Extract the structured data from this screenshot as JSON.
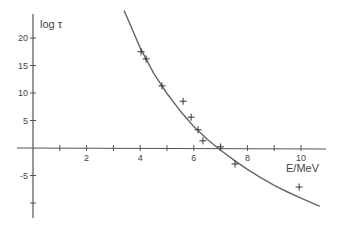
{
  "chart_data": {
    "type": "scatter",
    "title": "",
    "xlabel": "E/MeV",
    "ylabel": "log τ",
    "xlim": [
      0,
      11
    ],
    "ylim": [
      -12,
      25
    ],
    "grid": false,
    "x_ticks": [
      1,
      2,
      3,
      4,
      5,
      6,
      7,
      8,
      9,
      10
    ],
    "x_tick_labels": [
      "2",
      "4",
      "6",
      "8",
      "10"
    ],
    "x_tick_label_values": [
      2,
      4,
      6,
      8,
      10
    ],
    "y_ticks": [
      20,
      15,
      10,
      5,
      -5,
      -10
    ],
    "y_tick_labels": [
      "20",
      "15",
      "10",
      "5",
      "-5"
    ],
    "y_tick_label_values": [
      20,
      15,
      10,
      5,
      -5
    ],
    "series": [
      {
        "name": "measured",
        "marker": "+",
        "x": [
          4.03,
          4.22,
          4.81,
          5.6,
          5.9,
          6.16,
          6.34,
          7.0,
          7.54,
          9.93
        ],
        "y": [
          17.5,
          16.2,
          11.3,
          8.5,
          5.6,
          3.3,
          1.3,
          0.2,
          -2.9,
          -7.1
        ]
      },
      {
        "name": "fit",
        "style": "line",
        "x": [
          3.4,
          4.0,
          4.5,
          5.0,
          5.5,
          6.0,
          6.5,
          7.0,
          7.5,
          8.0,
          8.5,
          9.0,
          9.5,
          10.0,
          10.7
        ],
        "y": [
          25.0,
          18.2,
          13.6,
          9.9,
          6.7,
          3.9,
          1.6,
          -0.4,
          -2.2,
          -3.9,
          -5.4,
          -6.8,
          -8.0,
          -9.1,
          -10.6
        ]
      }
    ]
  },
  "axes": {
    "xlabel": "E/MeV",
    "ylabel": "log τ"
  }
}
